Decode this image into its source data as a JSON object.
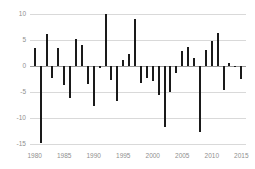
{
  "chart_data": {
    "type": "bar",
    "title": "",
    "subtitle": "",
    "xlabel": "",
    "ylabel": "",
    "xlim": [
      1979.2,
      2015.8
    ],
    "ylim": [
      -15.6,
      10.4
    ],
    "grid": true,
    "legend": null,
    "bar_color": "#1a1a1a",
    "gridline_color": "#d9d9d9",
    "axis_text_color": "#8f8f8f",
    "yticks": [
      10,
      5,
      0,
      -5,
      -10,
      -15
    ],
    "ytick_labels": [
      "10",
      "5",
      "0",
      "-5",
      "-10",
      "-15"
    ],
    "xticks": [
      1980,
      1985,
      1990,
      1995,
      2000,
      2005,
      2010,
      2015
    ],
    "xtick_labels": [
      "1980",
      "1985",
      "1990",
      "1995",
      "2000",
      "2005",
      "2010",
      "2015"
    ],
    "categories": [
      1980,
      1981,
      1982,
      1983,
      1984,
      1985,
      1986,
      1987,
      1988,
      1989,
      1990,
      1991,
      1992,
      1993,
      1994,
      1995,
      1996,
      1997,
      1998,
      1999,
      2000,
      2001,
      2002,
      2003,
      2004,
      2005,
      2006,
      2007,
      2008,
      2009,
      2010,
      2011,
      2012,
      2013,
      2014,
      2015
    ],
    "values": [
      3.4,
      -14.9,
      6.1,
      -2.3,
      3.5,
      -3.7,
      -6.2,
      5.2,
      4.1,
      -3.5,
      -7.7,
      -0.4,
      10.0,
      -2.6,
      -6.8,
      1.1,
      2.4,
      9.0,
      -3.2,
      -2.4,
      -2.9,
      -5.5,
      -11.7,
      -5.1,
      -1.3,
      2.8,
      3.6,
      1.5,
      -12.8,
      3.0,
      4.8,
      6.3,
      -4.7,
      0.5,
      -0.2,
      -2.5
    ]
  }
}
